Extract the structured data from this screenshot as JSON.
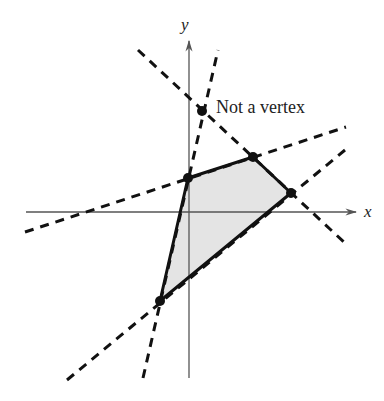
{
  "diagram": {
    "type": "feasible-region",
    "axes": {
      "x_label": "x",
      "y_label": "y",
      "origin_px": [
        189,
        212
      ]
    },
    "annotation": {
      "text": "Not a vertex",
      "point_px": [
        202,
        111
      ]
    },
    "region": {
      "fill": "#e4e4e4",
      "stroke": "#111111",
      "vertices_px": [
        [
          188,
          178
        ],
        [
          253,
          157
        ],
        [
          291,
          193
        ],
        [
          160,
          301
        ]
      ]
    },
    "boundary_lines_px": [
      {
        "from": [
          143,
          378
        ],
        "to": [
          218,
          50
        ]
      },
      {
        "from": [
          25,
          232
        ],
        "to": [
          346,
          127
        ]
      },
      {
        "from": [
          138,
          50
        ],
        "to": [
          346,
          244
        ]
      },
      {
        "from": [
          67,
          380
        ],
        "to": [
          345,
          150
        ]
      }
    ]
  }
}
